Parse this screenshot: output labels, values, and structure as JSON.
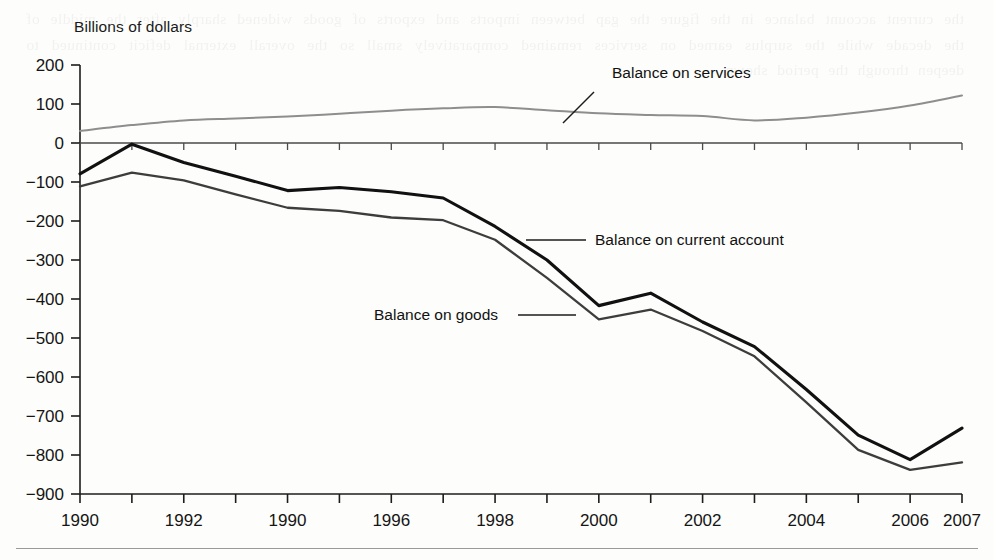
{
  "figure": {
    "unit_label": "Billions of dollars"
  },
  "chart_data": {
    "type": "line",
    "title": "",
    "subtitle": "",
    "xlabel": "",
    "ylabel": "Billions of dollars",
    "ylim": [
      -900,
      200
    ],
    "xlim": [
      1990,
      2007
    ],
    "ytick_step": 100,
    "yticks": [
      200,
      100,
      0,
      -100,
      -200,
      -300,
      -400,
      -500,
      -600,
      -700,
      -800,
      -900
    ],
    "ytick_labels": [
      "200",
      "100",
      "0",
      "−100",
      "−200",
      "−300",
      "−400",
      "−500",
      "−600",
      "−700",
      "−800",
      "−900"
    ],
    "x": [
      1990,
      1991,
      1992,
      1993,
      1994,
      1995,
      1996,
      1997,
      1998,
      1999,
      2000,
      2001,
      2002,
      2003,
      2004,
      2005,
      2006,
      2007
    ],
    "xticks": [
      1990,
      1991,
      1992,
      1993,
      1994,
      1995,
      1996,
      1997,
      1998,
      1999,
      2000,
      2001,
      2002,
      2003,
      2004,
      2005,
      2006,
      2007
    ],
    "xtick_labels": [
      {
        "x": 1990,
        "label": "1990"
      },
      {
        "x": 1992,
        "label": "1992"
      },
      {
        "x": 1994,
        "label": "1990"
      },
      {
        "x": 1996,
        "label": "1996"
      },
      {
        "x": 1998,
        "label": "1998"
      },
      {
        "x": 2000,
        "label": "2000"
      },
      {
        "x": 2002,
        "label": "2002"
      },
      {
        "x": 2004,
        "label": "2004"
      },
      {
        "x": 2006,
        "label": "2006"
      },
      {
        "x": 2007,
        "label": "2007"
      }
    ],
    "grid": false,
    "legend_position": "inline-annotations",
    "series": [
      {
        "name": "Balance on services",
        "color": "#8e8e8e",
        "width": 2.0,
        "smooth": true,
        "values": [
          31,
          46,
          58,
          63,
          68,
          75,
          83,
          89,
          92,
          84,
          76,
          72,
          69,
          58,
          65,
          78,
          96,
          122
        ]
      },
      {
        "name": "Balance on current account",
        "color": "#111111",
        "width": 3.1,
        "smooth": false,
        "values": [
          -79,
          -3,
          -50,
          -85,
          -122,
          -114,
          -125,
          -141,
          -214,
          -300,
          -417,
          -385,
          -459,
          -522,
          -632,
          -749,
          -812,
          -731
        ]
      },
      {
        "name": "Balance on goods",
        "color": "#3d3d3d",
        "width": 2.3,
        "smooth": false,
        "values": [
          -111,
          -76,
          -96,
          -132,
          -166,
          -174,
          -191,
          -198,
          -248,
          -346,
          -452,
          -427,
          -482,
          -547,
          -665,
          -787,
          -838,
          -819
        ]
      }
    ],
    "annotations": [
      {
        "name": "balance-on-services",
        "text": "Balance on services",
        "text_x": 612,
        "text_y": 78,
        "leader": [
          [
            594,
            92
          ],
          [
            563,
            123
          ]
        ]
      },
      {
        "name": "balance-on-current-account",
        "text": "Balance on current account",
        "text_x": 595,
        "text_y": 245,
        "leader": [
          [
            586,
            240
          ],
          [
            526,
            240
          ]
        ]
      },
      {
        "name": "balance-on-goods",
        "text": "Balance on goods",
        "text_x": 374,
        "text_y": 320,
        "leader": [
          [
            518,
            315
          ],
          [
            576,
            315
          ]
        ]
      }
    ]
  },
  "ghost_text": "the current account balance in the figure the gap between imports and exports of goods widened sharply after the middle of the decade while the surplus earned on services remained comparatively small so the overall external deficit continued to deepen through the period shown"
}
